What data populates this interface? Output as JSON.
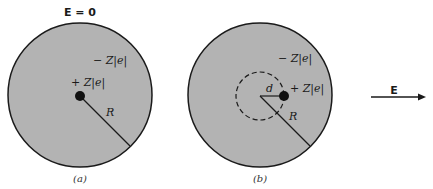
{
  "panel_a": {
    "top_label": "E = 0",
    "electron_cloud_label": "− Z|e|",
    "nucleus_label": "+ Z|e|",
    "radius_label": "R",
    "caption": "(a)"
  },
  "panel_b": {
    "electron_cloud_label": "− Z|e|",
    "nucleus_label": "+ Z|e|",
    "displacement_label": "d",
    "radius_label": "R",
    "caption": "(b)"
  },
  "field_arrow": {
    "label": "E",
    "direction": "right"
  },
  "colors": {
    "sphere_fill": "#b3b3b3",
    "outline": "#1a1a1a",
    "nucleus": "#111111",
    "background": "#ffffff"
  }
}
